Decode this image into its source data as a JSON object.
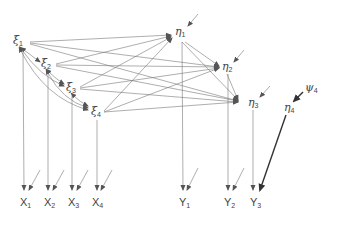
{
  "diagram": {
    "type": "structural-equation-path-diagram",
    "colors": {
      "line": "#666666",
      "text": "#444444",
      "bold_arrow": "#333333"
    },
    "exogenous_latents": [
      {
        "id": "xi1",
        "symbol": "ξ",
        "sub": "1"
      },
      {
        "id": "xi2",
        "symbol": "ξ",
        "sub": "2"
      },
      {
        "id": "xi3",
        "symbol": "ξ",
        "sub": "3"
      },
      {
        "id": "xi4",
        "symbol": "ξ",
        "sub": "4"
      }
    ],
    "endogenous_latents": [
      {
        "id": "eta1",
        "symbol": "η",
        "sub": "1"
      },
      {
        "id": "eta2",
        "symbol": "η",
        "sub": "2"
      },
      {
        "id": "eta3",
        "symbol": "η",
        "sub": "3"
      },
      {
        "id": "eta4",
        "symbol": "η",
        "sub": "4"
      }
    ],
    "disturbance": {
      "id": "psi4",
      "symbol": "ψ",
      "sub": "4"
    },
    "x_indicators": [
      {
        "id": "X1",
        "symbol": "X",
        "sub": "1"
      },
      {
        "id": "X2",
        "symbol": "X",
        "sub": "2"
      },
      {
        "id": "X3",
        "symbol": "X",
        "sub": "3"
      },
      {
        "id": "X4",
        "symbol": "X",
        "sub": "4"
      }
    ],
    "y_indicators": [
      {
        "id": "Y1",
        "symbol": "Y",
        "sub": "1"
      },
      {
        "id": "Y2",
        "symbol": "Y",
        "sub": "2"
      },
      {
        "id": "Y3",
        "symbol": "Y",
        "sub": "3"
      }
    ]
  }
}
